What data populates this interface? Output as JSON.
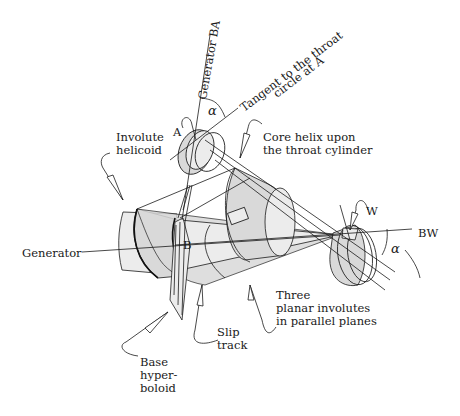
{
  "diagram": {
    "labels": {
      "generator_ba": "Generator BA",
      "tangent_line1": "Tangent to the throat",
      "tangent_line2": "circle at A",
      "alpha_top": "α",
      "point_a": "A",
      "involute_line1": "Involute",
      "involute_line2": "helicoid",
      "core_line1": "Core helix upon",
      "core_line2": "the throat cylinder",
      "generator": "Generator",
      "point_b": "B",
      "point_w": "W",
      "bw": "BW",
      "alpha_right": "α",
      "three_line1": "Three",
      "three_line2": "planar involutes",
      "three_line3": "in parallel planes",
      "slip_line1": "Slip",
      "slip_line2": "track",
      "base_line1": "Base",
      "base_line2": "hyper-",
      "base_line3": "boloid"
    },
    "colors": {
      "ink": "#1a1a1a",
      "shade": "#d9d9d9",
      "light_shade": "#ececec",
      "background": "#ffffff"
    }
  }
}
